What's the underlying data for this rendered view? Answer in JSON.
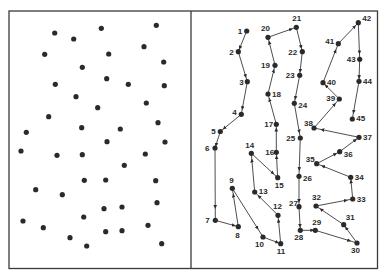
{
  "figure": {
    "left_panel": {
      "description": "Unordered scattered points",
      "points": [
        [
          54.7,
          33
        ],
        [
          73.7,
          39
        ],
        [
          101.3,
          28.3
        ],
        [
          156.3,
          25.3
        ],
        [
          44.7,
          54.3
        ],
        [
          108.7,
          54
        ],
        [
          144,
          46.7
        ],
        [
          163.7,
          62
        ],
        [
          82.3,
          67.3
        ],
        [
          55.3,
          84.3
        ],
        [
          106.7,
          78.7
        ],
        [
          128.3,
          84.3
        ],
        [
          164.3,
          85.7
        ],
        [
          76,
          96.7
        ],
        [
          97.7,
          107.7
        ],
        [
          146.3,
          103
        ],
        [
          48.7,
          116.7
        ],
        [
          81.7,
          127.7
        ],
        [
          120.3,
          129
        ],
        [
          158,
          122.7
        ],
        [
          26.3,
          132.3
        ],
        [
          107,
          141.7
        ],
        [
          165,
          142
        ],
        [
          21,
          151
        ],
        [
          57,
          155.3
        ],
        [
          82.3,
          154.7
        ],
        [
          145.3,
          154
        ],
        [
          124.3,
          165.3
        ],
        [
          84.3,
          180.3
        ],
        [
          105.7,
          180
        ],
        [
          155.7,
          180.7
        ],
        [
          35.7,
          189.7
        ],
        [
          62.3,
          194.7
        ],
        [
          104,
          208.7
        ],
        [
          122,
          207
        ],
        [
          157,
          202.7
        ],
        [
          83.7,
          217
        ],
        [
          23,
          221
        ],
        [
          43.3,
          227.7
        ],
        [
          148,
          225.3
        ],
        [
          105.7,
          231.7
        ],
        [
          122,
          230.7
        ],
        [
          70,
          237.7
        ],
        [
          86.7,
          246
        ],
        [
          161.7,
          243.7
        ]
      ]
    },
    "right_panel": {
      "description": "Same points visited in numbered order (tour path with arrows)",
      "points": [
        {
          "n": "1",
          "x": 246.7,
          "y": 31,
          "lx": -9,
          "ly": 3
        },
        {
          "n": "2",
          "x": 238.3,
          "y": 51.7,
          "lx": -9,
          "ly": 3
        },
        {
          "n": "3",
          "x": 247.3,
          "y": 81.7,
          "lx": -8,
          "ly": 3
        },
        {
          "n": "4",
          "x": 241.3,
          "y": 114.3,
          "lx": -9,
          "ly": 1
        },
        {
          "n": "5",
          "x": 220.3,
          "y": 131.5,
          "lx": -9,
          "ly": 2
        },
        {
          "n": "6",
          "x": 215,
          "y": 148,
          "lx": -10,
          "ly": 3
        },
        {
          "n": "7",
          "x": 215.3,
          "y": 220.3,
          "lx": -10,
          "ly": 3
        },
        {
          "n": "8",
          "x": 238.3,
          "y": 226.7,
          "lx": -3,
          "ly": 11
        },
        {
          "n": "9",
          "x": 232.3,
          "y": 188.3,
          "lx": -3,
          "ly": -5
        },
        {
          "n": "10",
          "x": 263,
          "y": 237,
          "lx": -8,
          "ly": 10
        },
        {
          "n": "11",
          "x": 280.7,
          "y": 243.7,
          "lx": -4,
          "ly": 10
        },
        {
          "n": "12",
          "x": 278,
          "y": 215.3,
          "lx": -5,
          "ly": -6
        },
        {
          "n": "13",
          "x": 254.7,
          "y": 192,
          "lx": 4,
          "ly": 2
        },
        {
          "n": "14",
          "x": 251.3,
          "y": 153.3,
          "lx": -6,
          "ly": -5
        },
        {
          "n": "15",
          "x": 277.7,
          "y": 177.7,
          "lx": -3,
          "ly": 10
        },
        {
          "n": "16",
          "x": 276.3,
          "y": 152.3,
          "lx": -11,
          "ly": 3
        },
        {
          "n": "17",
          "x": 276.3,
          "y": 124.3,
          "lx": -12,
          "ly": 3
        },
        {
          "n": "18",
          "x": 268,
          "y": 94,
          "lx": 4,
          "ly": 3
        },
        {
          "n": "19",
          "x": 275,
          "y": 65.3,
          "lx": -14,
          "ly": 3
        },
        {
          "n": "20",
          "x": 268,
          "y": 37.3,
          "lx": -7,
          "ly": -6
        },
        {
          "n": "21",
          "x": 296.3,
          "y": 27.3,
          "lx": -4,
          "ly": -6
        },
        {
          "n": "22",
          "x": 302.3,
          "y": 51.7,
          "lx": -14,
          "ly": 3
        },
        {
          "n": "23",
          "x": 299.7,
          "y": 75.3,
          "lx": -14,
          "ly": 3
        },
        {
          "n": "24",
          "x": 294.3,
          "y": 103.3,
          "lx": 4,
          "ly": 5
        },
        {
          "n": "25",
          "x": 300.3,
          "y": 138,
          "lx": -14,
          "ly": 3
        },
        {
          "n": "26",
          "x": 299,
          "y": 176.3,
          "lx": 4,
          "ly": 5
        },
        {
          "n": "27",
          "x": 299,
          "y": 206.7,
          "lx": -10,
          "ly": -1
        },
        {
          "n": "28",
          "x": 300.3,
          "y": 230.3,
          "lx": -6,
          "ly": 10
        },
        {
          "n": "29",
          "x": 315.3,
          "y": 230.3,
          "lx": -3,
          "ly": -5
        },
        {
          "n": "30",
          "x": 357,
          "y": 243,
          "lx": -6,
          "ly": 10
        },
        {
          "n": "31",
          "x": 343.7,
          "y": 224.7,
          "lx": 2,
          "ly": -5
        },
        {
          "n": "32",
          "x": 316,
          "y": 206,
          "lx": -4,
          "ly": -6
        },
        {
          "n": "33",
          "x": 352.7,
          "y": 199,
          "lx": 4,
          "ly": 3
        },
        {
          "n": "34",
          "x": 350.7,
          "y": 177.3,
          "lx": 4,
          "ly": 3
        },
        {
          "n": "35",
          "x": 316.7,
          "y": 163.7,
          "lx": -11,
          "ly": -2
        },
        {
          "n": "36",
          "x": 339.7,
          "y": 151.7,
          "lx": 4,
          "ly": 5
        },
        {
          "n": "37",
          "x": 359,
          "y": 137.3,
          "lx": 4,
          "ly": 3
        },
        {
          "n": "38",
          "x": 314,
          "y": 128,
          "lx": -10,
          "ly": -2
        },
        {
          "n": "39",
          "x": 339.3,
          "y": 99,
          "lx": -13,
          "ly": 2
        },
        {
          "n": "40",
          "x": 323,
          "y": 82.7,
          "lx": 4,
          "ly": 2
        },
        {
          "n": "41",
          "x": 338.3,
          "y": 43.7,
          "lx": -13,
          "ly": 0
        },
        {
          "n": "42",
          "x": 358.3,
          "y": 22.7,
          "lx": 4,
          "ly": -2
        },
        {
          "n": "43",
          "x": 359.7,
          "y": 59.3,
          "lx": -13,
          "ly": 3
        },
        {
          "n": "44",
          "x": 359,
          "y": 81.3,
          "lx": 4,
          "ly": 3
        },
        {
          "n": "45",
          "x": 352.3,
          "y": 119,
          "lx": 4,
          "ly": 2
        }
      ]
    },
    "colors": {
      "ink": "#2a2a2a",
      "frame": "#3a3a3a",
      "background": "#ffffff"
    }
  }
}
